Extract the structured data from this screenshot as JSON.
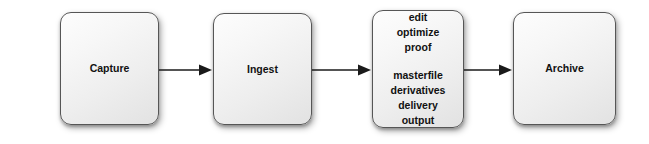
{
  "diagram": {
    "type": "linear-process-flow",
    "background_color": "#ffffff",
    "node_border_color": "#565656",
    "node_fill_top": "#fdfdfd",
    "node_fill_bottom": "#e2e2e2",
    "text_color": "#111111",
    "arrow_color": "#1a1a1a",
    "nodes": [
      {
        "id": "capture",
        "label": "Capture",
        "lines": [
          "Capture"
        ],
        "groups": [
          [
            "Capture"
          ]
        ]
      },
      {
        "id": "ingest",
        "label": "Ingest",
        "lines": [
          "Ingest"
        ],
        "groups": [
          [
            "Ingest"
          ]
        ]
      },
      {
        "id": "process",
        "label": "edit optimize proof masterfile derivatives delivery output",
        "lines": [
          "edit",
          "optimize",
          "proof",
          "masterfile",
          "derivatives",
          "delivery",
          "output"
        ],
        "groups": [
          [
            "edit",
            "optimize",
            "proof"
          ],
          [
            "masterfile",
            "derivatives",
            "delivery",
            "output"
          ]
        ]
      },
      {
        "id": "archive",
        "label": "Archive",
        "lines": [
          "Archive"
        ],
        "groups": [
          [
            "Archive"
          ]
        ]
      }
    ],
    "connectors": [
      {
        "id": "capture-to-ingest",
        "from": "capture",
        "to": "ingest"
      },
      {
        "id": "ingest-to-process",
        "from": "ingest",
        "to": "process"
      },
      {
        "id": "process-to-archive",
        "from": "process",
        "to": "archive"
      }
    ]
  }
}
